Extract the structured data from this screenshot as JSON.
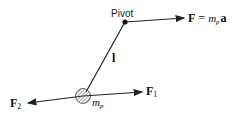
{
  "diagram": {
    "pivot_label": "Pivot",
    "rod_label": "l",
    "mass_label_base": "m",
    "mass_label_sub": "p",
    "force_top": {
      "symbol": "F",
      "eq": " = ",
      "m": "m",
      "sub": "p",
      "a": "a"
    },
    "force_1": {
      "symbol": "F",
      "sub": "1"
    },
    "force_2": {
      "symbol": "F",
      "sub": "2"
    },
    "colors": {
      "line": "#222222",
      "hatch": "#555555"
    }
  }
}
